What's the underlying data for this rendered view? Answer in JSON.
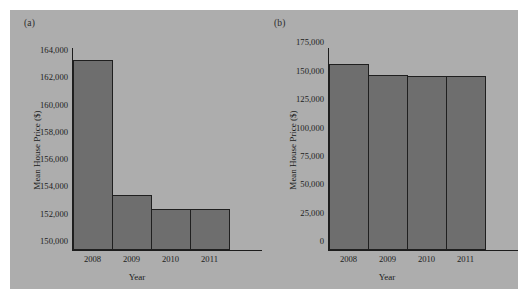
{
  "figure": {
    "background_color": "#adadad",
    "page_color": "#ffffff",
    "bar_color": "#6e6e6e",
    "axis_color": "#1d1d1d"
  },
  "panels": [
    {
      "label": "(a)"
    },
    {
      "label": "(b)"
    }
  ],
  "chart_data": [
    {
      "type": "bar",
      "panel_label": "(a)",
      "title": "",
      "categories": [
        "2008",
        "2009",
        "2010",
        "2011"
      ],
      "values": [
        163900,
        154000,
        153000,
        153000
      ],
      "xlabel": "Year",
      "ylabel": "Mean House Price ($)",
      "ylim": [
        150000,
        164800
      ],
      "yticks": [
        150000,
        152000,
        154000,
        156000,
        158000,
        160000,
        162000,
        164000
      ],
      "ytick_labels": [
        "150,000",
        "152,000",
        "154,000",
        "156,000",
        "158,000",
        "160,000",
        "162,000",
        "164,000"
      ],
      "grid": false,
      "legend": "none"
    },
    {
      "type": "bar",
      "panel_label": "(b)",
      "title": "",
      "categories": [
        "2008",
        "2009",
        "2010",
        "2011"
      ],
      "values": [
        163900,
        154000,
        153000,
        153000
      ],
      "xlabel": "Year",
      "ylabel": "Mean House Price ($)",
      "ylim": [
        0,
        178000
      ],
      "yticks": [
        0,
        25000,
        50000,
        75000,
        100000,
        125000,
        150000,
        175000
      ],
      "ytick_labels": [
        "0",
        "25,000",
        "50,000",
        "75,000",
        "100,000",
        "125,000",
        "150,000",
        "175,000"
      ],
      "grid": false,
      "legend": "none"
    }
  ]
}
